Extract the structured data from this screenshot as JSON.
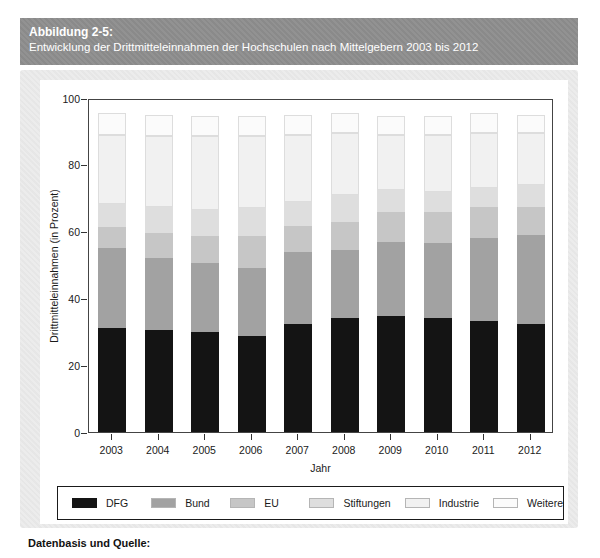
{
  "figure": {
    "label": "Abbildung 2-5:",
    "title": "Entwicklung der Drittmitteleinnahmen der Hochschulen nach Mittelgebern 2003 bis 2012"
  },
  "chart_data": {
    "type": "bar",
    "stacked": true,
    "title": "",
    "xlabel": "Jahr",
    "ylabel": "Drittmitteleinnahmen (in Prozent)",
    "ylim": [
      0,
      100
    ],
    "yticks": [
      0,
      20,
      40,
      60,
      80,
      100
    ],
    "grid": false,
    "legend_position": "bottom",
    "categories": [
      "2003",
      "2004",
      "2005",
      "2006",
      "2007",
      "2008",
      "2009",
      "2010",
      "2011",
      "2012"
    ],
    "series": [
      {
        "name": "DFG",
        "color": "#141414",
        "values": [
          31.2,
          30.5,
          29.8,
          28.7,
          32.2,
          34.0,
          34.8,
          34.2,
          33.3,
          32.2
        ]
      },
      {
        "name": "Bund",
        "color": "#a2a2a2",
        "values": [
          24.0,
          21.5,
          20.7,
          20.3,
          21.8,
          20.5,
          22.2,
          22.3,
          24.7,
          26.8
        ]
      },
      {
        "name": "EU",
        "color": "#c6c6c6",
        "values": [
          6.3,
          7.5,
          8.3,
          9.8,
          7.8,
          8.5,
          9.0,
          9.5,
          9.5,
          8.5
        ]
      },
      {
        "name": "Stiftungen",
        "color": "#dedede",
        "values": [
          6.7,
          7.8,
          7.7,
          8.2,
          7.0,
          8.0,
          6.5,
          6.0,
          5.5,
          6.5
        ]
      },
      {
        "name": "Industrie",
        "color": "#f1f1f1",
        "values": [
          20.8,
          21.2,
          22.0,
          21.5,
          20.2,
          18.5,
          16.5,
          17.0,
          16.5,
          15.5
        ]
      },
      {
        "name": "Weitere",
        "color": "#fbfbfb",
        "values": [
          6.5,
          6.3,
          6.0,
          6.0,
          6.0,
          6.0,
          5.5,
          5.5,
          6.0,
          5.5
        ]
      }
    ]
  },
  "footer": {
    "label": "Datenbasis und Quelle:"
  }
}
